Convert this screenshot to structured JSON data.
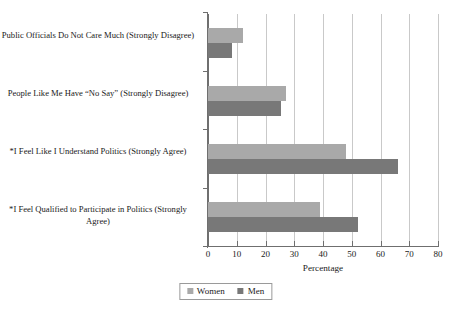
{
  "chart_data": {
    "type": "bar",
    "orientation": "horizontal",
    "title": "",
    "xlabel": "Percentage",
    "ylabel": "",
    "xlim": [
      0,
      80
    ],
    "xticks": [
      0,
      10,
      20,
      30,
      40,
      50,
      60,
      70,
      80
    ],
    "grid": true,
    "legend_position": "bottom-center",
    "categories": [
      "Public Officials Do Not Care Much (Strongly Disagree)",
      "People Like Me Have “No Say” (Strongly Disagree)",
      "*I Feel Like I Understand Politics (Strongly Agree)",
      "*I Feel Qualified to Participate in Politics (Strongly Agree)"
    ],
    "series": [
      {
        "name": "Women",
        "color": "#a9a9a9",
        "values": [
          12,
          27,
          48,
          39
        ]
      },
      {
        "name": "Men",
        "color": "#787878",
        "values": [
          8.5,
          25.5,
          66,
          52
        ]
      }
    ]
  },
  "axis": {
    "x_title": "Percentage",
    "tick_labels": [
      "0",
      "10",
      "20",
      "30",
      "40",
      "50",
      "60",
      "70",
      "80"
    ]
  },
  "legend": {
    "items": [
      {
        "label": "Women",
        "color": "#a9a9a9"
      },
      {
        "label": "Men",
        "color": "#787878"
      }
    ]
  },
  "colors": {
    "women": "#a9a9a9",
    "men": "#787878",
    "axis": "#6f6f6f",
    "grid": "#c9c9c9",
    "text": "#1a1a1a",
    "background": "#ffffff"
  }
}
